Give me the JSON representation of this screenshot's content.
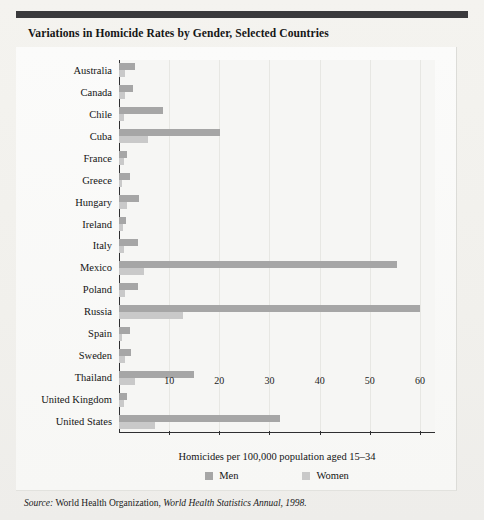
{
  "figure": {
    "title": "Variations in Homicide Rates by Gender, Selected Countries",
    "source_lead": "Source:",
    "source_org": " World Health Organization, ",
    "source_publication": "World Health Statistics Annual, 1998."
  },
  "colors": {
    "men": "#a6a6a6",
    "women": "#c9c9c9",
    "axis": "#2f2f31",
    "rule": "#3a3a3c",
    "page": "#f3f2ee"
  },
  "chart_data": {
    "type": "bar",
    "orientation": "horizontal",
    "title": "Variations in Homicide Rates by Gender, Selected Countries",
    "xlabel": "Homicides per 100,000 population aged 15–34",
    "ylabel": "",
    "xlim": [
      0,
      63
    ],
    "xticks": [
      10,
      20,
      30,
      40,
      50,
      60
    ],
    "xticklabels": [
      "10",
      "20",
      "30",
      "40",
      "50",
      "60"
    ],
    "grid": "vertical",
    "legend_position": "bottom",
    "categories": [
      "Australia",
      "Canada",
      "Chile",
      "Cuba",
      "France",
      "Greece",
      "Hungary",
      "Ireland",
      "Italy",
      "Mexico",
      "Poland",
      "Russia",
      "Spain",
      "Sweden",
      "Thailand",
      "United Kingdom",
      "United States"
    ],
    "series": [
      {
        "name": "Men",
        "color": "#a6a6a6",
        "values": [
          3.2,
          2.8,
          8.7,
          20.1,
          1.6,
          2.2,
          4.0,
          1.3,
          3.8,
          55.5,
          3.8,
          60.0,
          2.1,
          2.3,
          14.9,
          1.6,
          32.0
        ]
      },
      {
        "name": "Women",
        "color": "#c9c9c9",
        "values": [
          1.2,
          1.1,
          1.0,
          5.8,
          0.9,
          0.6,
          1.6,
          0.8,
          0.9,
          4.9,
          1.1,
          12.8,
          0.6,
          1.2,
          3.1,
          0.9,
          7.1
        ]
      }
    ]
  },
  "legend": {
    "items": [
      {
        "label": "Men",
        "color": "#a6a6a6"
      },
      {
        "label": "Women",
        "color": "#c9c9c9"
      }
    ]
  }
}
